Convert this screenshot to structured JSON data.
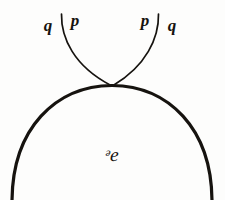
{
  "figure": {
    "caption_kind": "cusp-tangency-diagram",
    "background_color": "#fdfdfc",
    "ink_color": "#16130f",
    "width": 225,
    "height": 200,
    "region_label": {
      "text": "ᵊe",
      "x": 112,
      "y": 154
    },
    "branch_labels": [
      {
        "text": "q",
        "x": 48,
        "y": 25,
        "side": "left",
        "role": "outer"
      },
      {
        "text": "p",
        "x": 75,
        "y": 20,
        "side": "left",
        "role": "inner"
      },
      {
        "text": "p",
        "x": 145,
        "y": 20,
        "side": "right",
        "role": "inner"
      },
      {
        "text": "q",
        "x": 172,
        "y": 25,
        "side": "right",
        "role": "outer"
      }
    ],
    "curves": [
      {
        "name": "boundary-arc",
        "role": "region-boundary",
        "stroke_width": 3.2,
        "path": "M 12 202 C 12 128, 56 86, 112 85.5 C 168 86, 212 128, 212 202"
      },
      {
        "name": "left-branch",
        "role": "tangent-branch",
        "stroke_width": 1.7,
        "path": "M 61.5 14 C 61 38, 74 66, 110.5 85.2"
      },
      {
        "name": "right-branch",
        "role": "tangent-branch",
        "stroke_width": 1.7,
        "path": "M 158.5 14 C 159 38, 146 66, 113.5 85.2"
      }
    ]
  }
}
